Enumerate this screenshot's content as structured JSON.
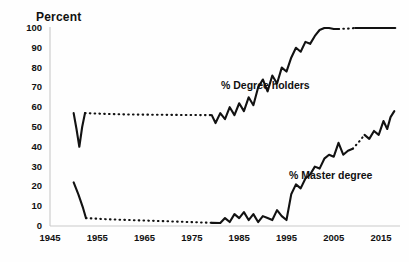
{
  "chart_data": {
    "type": "line",
    "title": "",
    "ylabel": "Percent",
    "xlabel": "",
    "ylim": [
      0,
      100
    ],
    "xlim": [
      1945,
      2019
    ],
    "grid": false,
    "legend_position": "inline-annotations",
    "y_ticks": [
      100,
      90,
      80,
      70,
      60,
      50,
      40,
      30,
      20,
      10,
      0
    ],
    "x_ticks": [
      1945,
      1955,
      1965,
      1975,
      1985,
      1995,
      2005,
      2015
    ],
    "annotations": [
      "% Degree holders",
      "% Master degree"
    ],
    "series": [
      {
        "name": "% Degree holders",
        "label": "% Degree holders",
        "color": "#121212",
        "segments": [
          {
            "style": "solid",
            "points": [
              [
                1950,
                57
              ],
              [
                1950.6,
                49
              ],
              [
                1951.2,
                40
              ],
              [
                1951.8,
                50
              ],
              [
                1952.4,
                57
              ]
            ]
          },
          {
            "style": "dotted",
            "points": [
              [
                1952.4,
                57
              ],
              [
                1957,
                56.6
              ],
              [
                1962,
                56.3
              ],
              [
                1967,
                56.2
              ],
              [
                1972,
                56.1
              ],
              [
                1977,
                56
              ],
              [
                1979.2,
                56
              ]
            ]
          },
          {
            "style": "solid",
            "points": [
              [
                1979.2,
                56
              ],
              [
                1980,
                52
              ],
              [
                1981,
                57
              ],
              [
                1982,
                54
              ],
              [
                1983,
                60
              ],
              [
                1984,
                56
              ],
              [
                1985,
                62
              ],
              [
                1986,
                58
              ],
              [
                1987,
                65
              ],
              [
                1988,
                61
              ],
              [
                1989,
                70
              ],
              [
                1990,
                74
              ],
              [
                1991,
                68
              ],
              [
                1992,
                76
              ],
              [
                1993,
                72
              ],
              [
                1994,
                80
              ],
              [
                1995,
                78
              ],
              [
                1996,
                85
              ],
              [
                1997,
                90
              ],
              [
                1998,
                88
              ],
              [
                1999,
                93
              ],
              [
                2000,
                92
              ],
              [
                2001,
                96
              ],
              [
                2002,
                99
              ],
              [
                2003,
                100
              ],
              [
                2004,
                100
              ],
              [
                2005,
                99.5
              ],
              [
                2006,
                99.5
              ]
            ]
          },
          {
            "style": "dotted",
            "points": [
              [
                2006,
                99.5
              ],
              [
                2008,
                99.7
              ],
              [
                2009.5,
                100
              ]
            ]
          },
          {
            "style": "solid",
            "points": [
              [
                2009.5,
                100
              ],
              [
                2012,
                100
              ],
              [
                2015,
                100
              ],
              [
                2018,
                100
              ]
            ]
          }
        ]
      },
      {
        "name": "% Master degree",
        "label": "% Master degree",
        "color": "#121212",
        "segments": [
          {
            "style": "solid",
            "points": [
              [
                1950,
                22
              ],
              [
                1951,
                16
              ],
              [
                1952,
                9
              ],
              [
                1952.6,
                4
              ]
            ]
          },
          {
            "style": "dotted",
            "points": [
              [
                1952.6,
                4
              ],
              [
                1957,
                3.4
              ],
              [
                1962,
                3
              ],
              [
                1967,
                2.6
              ],
              [
                1972,
                2.2
              ],
              [
                1977,
                1.8
              ],
              [
                1979.2,
                1.6
              ]
            ]
          },
          {
            "style": "solid",
            "points": [
              [
                1979.2,
                1.6
              ],
              [
                1981,
                1.5
              ],
              [
                1982,
                4
              ],
              [
                1983,
                2
              ],
              [
                1984,
                6
              ],
              [
                1985,
                4
              ],
              [
                1986,
                7
              ],
              [
                1987,
                3
              ],
              [
                1988,
                6
              ],
              [
                1989,
                2
              ],
              [
                1990,
                5
              ],
              [
                1991,
                4
              ],
              [
                1992,
                3
              ],
              [
                1993,
                8
              ],
              [
                1994,
                5
              ],
              [
                1995,
                3
              ],
              [
                1996,
                16
              ],
              [
                1997,
                21
              ],
              [
                1998,
                19
              ],
              [
                1999,
                24
              ],
              [
                2000,
                26
              ],
              [
                2001,
                30
              ],
              [
                2002,
                29
              ],
              [
                2003,
                34
              ],
              [
                2004,
                36
              ],
              [
                2005,
                35
              ],
              [
                2006,
                42
              ],
              [
                2007,
                36
              ],
              [
                2008,
                38
              ],
              [
                2009,
                39
              ]
            ]
          },
          {
            "style": "dotted",
            "points": [
              [
                2009,
                39
              ],
              [
                2010.5,
                43
              ],
              [
                2011.5,
                46
              ]
            ]
          },
          {
            "style": "solid",
            "points": [
              [
                2011.5,
                46
              ],
              [
                2012.5,
                44
              ],
              [
                2013.5,
                48
              ],
              [
                2014.5,
                46
              ],
              [
                2015.5,
                53
              ],
              [
                2016.3,
                49
              ],
              [
                2017,
                55
              ],
              [
                2017.8,
                58
              ]
            ]
          }
        ]
      }
    ]
  }
}
